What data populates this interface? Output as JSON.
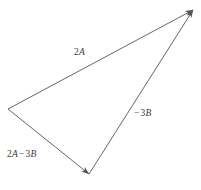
{
  "figure": {
    "type": "vector-triangle-diagram",
    "width": 201,
    "height": 190,
    "background_color": "#ffffff",
    "stroke_color": "#555555",
    "label_color": "#3a3a3a",
    "vertices": {
      "left": [
        8,
        109
      ],
      "apex": [
        193,
        10
      ],
      "bottom": [
        89,
        174
      ]
    },
    "vectors": [
      {
        "name": "2A",
        "coefficient": "2",
        "variable": "A",
        "operator": "",
        "from": [
          8,
          109
        ],
        "to": [
          193,
          10
        ],
        "arrowhead_at": "to",
        "label_position": [
          74,
          48
        ]
      },
      {
        "name": "-3B",
        "coefficient": "3",
        "variable": "B",
        "operator": "−",
        "from": [
          89,
          174
        ],
        "to": [
          193,
          10
        ],
        "arrowhead_at": "to",
        "label_position": [
          133,
          109
        ]
      },
      {
        "name": "2A-3B",
        "coefficient": "2",
        "variable": "A",
        "operator": "−",
        "from": [
          8,
          109
        ],
        "to": [
          89,
          174
        ],
        "arrowhead_at": "to",
        "label_position": [
          7,
          150
        ]
      }
    ]
  },
  "labels": {
    "vector_2a": {
      "coefficient": "2",
      "variable": "A"
    },
    "vector_neg_3b": {
      "operator": "−",
      "coefficient": "3",
      "variable": "B"
    },
    "vector_2a_minus_3b": {
      "coefficient_1": "2",
      "variable_1": "A",
      "operator": "−",
      "coefficient_2": "3",
      "variable_2": "B"
    }
  }
}
